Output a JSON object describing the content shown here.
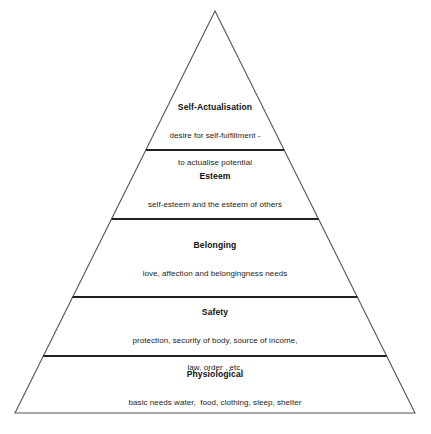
{
  "figure": {
    "name": "maslow-hierarchy-of-needs-pyramid",
    "type": "pyramid-diagram",
    "background_color": "#ffffff",
    "outline_color": "#555555",
    "divider_color": "#222222"
  },
  "geometry": {
    "apex": {
      "x": 215,
      "y": 11
    },
    "base_left": {
      "x": 15,
      "y": 413
    },
    "base_right": {
      "x": 415,
      "y": 413
    },
    "divider_y": [
      150,
      219,
      297,
      356
    ]
  },
  "tiers": [
    {
      "rank": 1,
      "id": "self-actualisation",
      "title": "Self-Actualisation",
      "description_lines": [
        "desire for self-fulfillment -",
        "to actualise potential"
      ]
    },
    {
      "rank": 2,
      "id": "esteem",
      "title": "Esteem",
      "description_lines": [
        "self-esteem and the esteem of others"
      ]
    },
    {
      "rank": 3,
      "id": "belonging",
      "title": "Belonging",
      "description_lines": [
        "love, affection and belongingness needs"
      ]
    },
    {
      "rank": 4,
      "id": "safety",
      "title": "Safety",
      "description_lines": [
        "protection, security of body, source of income,",
        "law, order , etc."
      ]
    },
    {
      "rank": 5,
      "id": "physiological",
      "title": "Physiological",
      "description_lines": [
        "basic needs water,  food, clothing, sleep, shelter"
      ]
    }
  ]
}
